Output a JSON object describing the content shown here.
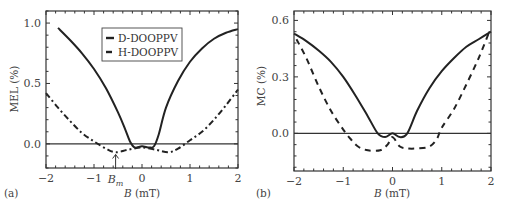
{
  "chart_data": [
    {
      "panel": "(a)",
      "type": "line",
      "title": "",
      "xlabel": "B (mT)",
      "ylabel": "MEL (%)",
      "xlim": [
        -2,
        2
      ],
      "ylim": [
        -0.2,
        1.1
      ],
      "x_ticks": [
        "-2",
        "-1",
        "0",
        "1",
        "2"
      ],
      "y_ticks": [
        "0.0",
        "0.5",
        "1.0"
      ],
      "annotation": "B_m",
      "annotation_x": -0.55,
      "legend": {
        "position": "upper center",
        "entries": [
          "D-DOOPPV",
          "H-DOOPPV"
        ]
      },
      "grid": false,
      "series": [
        {
          "name": "D-DOOPPV",
          "style": "solid",
          "x": [
            -1.75,
            -1.5,
            -1.25,
            -1.0,
            -0.75,
            -0.5,
            -0.35,
            -0.25,
            -0.15,
            0.0,
            0.15,
            0.25,
            0.35,
            0.5,
            0.75,
            1.0,
            1.25,
            1.5,
            1.75,
            2.0
          ],
          "y": [
            0.96,
            0.86,
            0.75,
            0.62,
            0.46,
            0.26,
            0.12,
            0.02,
            -0.03,
            -0.02,
            -0.03,
            -0.02,
            0.08,
            0.3,
            0.52,
            0.68,
            0.79,
            0.87,
            0.92,
            0.95
          ]
        },
        {
          "name": "H-DOOPPV",
          "style": "dash-dot",
          "x": [
            -2.0,
            -1.75,
            -1.5,
            -1.25,
            -1.0,
            -0.75,
            -0.55,
            -0.3,
            0.0,
            0.3,
            0.55,
            0.75,
            1.0,
            1.25,
            1.5,
            1.75,
            2.0
          ],
          "y": [
            0.42,
            0.3,
            0.19,
            0.09,
            0.02,
            -0.04,
            -0.07,
            -0.05,
            -0.03,
            -0.05,
            -0.07,
            -0.04,
            0.03,
            0.1,
            0.2,
            0.32,
            0.45
          ]
        }
      ]
    },
    {
      "panel": "(b)",
      "type": "line",
      "title": "",
      "xlabel": "B (mT)",
      "ylabel": "MC (%)",
      "xlim": [
        -2,
        2
      ],
      "ylim": [
        -0.2,
        0.65
      ],
      "x_ticks": [
        "-2",
        "-1",
        "0",
        "1",
        "2"
      ],
      "y_ticks": [
        "0.0",
        "0.3",
        "0.6"
      ],
      "grid": false,
      "series": [
        {
          "name": "D-DOOPPV",
          "style": "solid",
          "x": [
            -2.0,
            -1.75,
            -1.5,
            -1.25,
            -1.0,
            -0.75,
            -0.5,
            -0.3,
            -0.15,
            0.0,
            0.15,
            0.3,
            0.5,
            0.75,
            1.0,
            1.25,
            1.5,
            1.75,
            2.0
          ],
          "y": [
            0.53,
            0.49,
            0.44,
            0.38,
            0.3,
            0.2,
            0.09,
            0.0,
            -0.02,
            0.0,
            -0.02,
            0.0,
            0.12,
            0.24,
            0.33,
            0.4,
            0.46,
            0.5,
            0.54
          ]
        },
        {
          "name": "H-DOOPPV",
          "style": "dashed",
          "x": [
            -1.95,
            -1.75,
            -1.5,
            -1.25,
            -1.0,
            -0.85,
            -0.7,
            -0.5,
            -0.25,
            -0.1,
            0.0,
            0.15,
            0.3,
            0.5,
            0.75,
            0.9,
            1.0,
            1.25,
            1.5,
            1.75,
            1.95
          ],
          "y": [
            0.5,
            0.4,
            0.25,
            0.12,
            0.02,
            -0.03,
            -0.07,
            -0.09,
            -0.09,
            -0.06,
            -0.02,
            -0.07,
            -0.08,
            -0.08,
            -0.07,
            -0.03,
            0.03,
            0.13,
            0.26,
            0.4,
            0.53
          ]
        }
      ]
    }
  ],
  "panels": {
    "a": {
      "label": "(a)",
      "ylabel": "MEL (%)",
      "xlabel_var": "B",
      "xlabel_unit": " (mT)",
      "annotation_main": "B",
      "annotation_sub": "m",
      "legend": [
        "D-DOOPPV",
        "H-DOOPPV"
      ]
    },
    "b": {
      "label": "(b)",
      "ylabel": "MC (%)",
      "xlabel_var": "B",
      "xlabel_unit": " (mT)"
    }
  }
}
